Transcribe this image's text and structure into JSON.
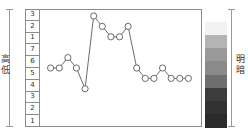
{
  "left_axis": {
    "high_label": "高",
    "low_label": "低",
    "tick_labels": [
      "3",
      "2",
      "1",
      "7",
      "6",
      "5",
      "4",
      "3",
      "2",
      "1"
    ]
  },
  "right_legend": {
    "bright_label": "明",
    "dark_label": "暗",
    "bands": [
      {
        "name": "band-1",
        "color": "#ffffff"
      },
      {
        "name": "band-2",
        "color": "#f2f2f2"
      },
      {
        "name": "band-3",
        "color": "#b4b4b4"
      },
      {
        "name": "band-4",
        "color": "#9a9a9a"
      },
      {
        "name": "band-5",
        "color": "#8a8a8a"
      },
      {
        "name": "band-6",
        "color": "#6e6e6e"
      },
      {
        "name": "band-7",
        "color": "#3c3c3c"
      },
      {
        "name": "band-8",
        "color": "#323232"
      },
      {
        "name": "band-9",
        "color": "#2a2a2a"
      }
    ]
  },
  "chart_data": {
    "type": "line",
    "title": "",
    "xlabel": "",
    "ylabel": "高 / 低",
    "grid": true,
    "legend": "none",
    "marker": "open-circle",
    "line_color": "#5a5a5a",
    "marker_fill": "#ffffff",
    "x": [
      1,
      2,
      3,
      4,
      5,
      6,
      7,
      8,
      9,
      10,
      11,
      12,
      13,
      14,
      15,
      16,
      17
    ],
    "values": [
      5,
      5,
      6,
      5,
      3,
      10,
      9,
      8,
      8,
      9,
      5,
      4,
      4,
      5,
      4,
      4,
      4
    ],
    "ylim": [
      0,
      10
    ],
    "xlim": [
      0,
      18
    ],
    "tick_labels": [
      "3",
      "2",
      "1",
      "7",
      "6",
      "5",
      "4",
      "3",
      "2",
      "1"
    ]
  }
}
